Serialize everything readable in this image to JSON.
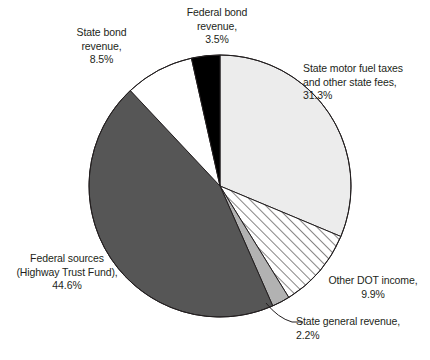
{
  "chart_data": {
    "type": "pie",
    "title": "",
    "subtitle": "",
    "xlabel": "",
    "ylabel": "",
    "legend_position": "none",
    "grid": false,
    "units": "percent",
    "start_angle_deg": 0,
    "direction": "clockwise",
    "categories": [
      "State motor fuel taxes and other state fees",
      "Other DOT income",
      "State general revenue",
      "Federal sources (Highway Trust Fund)",
      "State bond revenue",
      "Federal bond revenue"
    ],
    "values": [
      31.3,
      9.9,
      2.2,
      44.6,
      8.5,
      3.5
    ],
    "slices": [
      {
        "name": "state-motor-fuel-taxes",
        "label": "State motor fuel taxes\nand other state fees,\n31.3%",
        "value": 31.3,
        "value_text": "31.3%",
        "fill": "#ececec",
        "pattern": "solid",
        "start_deg": 0,
        "end_deg": 112.68
      },
      {
        "name": "other-dot-income",
        "label": "Other DOT income,\n9.9%",
        "value": 9.9,
        "value_text": "9.9%",
        "fill": "#ffffff",
        "pattern": "diagonal-hatch",
        "start_deg": 112.68,
        "end_deg": 148.32
      },
      {
        "name": "state-general-revenue",
        "label": "State general revenue,\n2.2%",
        "value": 2.2,
        "value_text": "2.2%",
        "fill": "#b2b2b2",
        "pattern": "solid",
        "start_deg": 148.32,
        "end_deg": 156.24
      },
      {
        "name": "federal-sources-highway-trust-fund",
        "label": "Federal sources\n(Highway Trust Fund),\n44.6%",
        "value": 44.6,
        "value_text": "44.6%",
        "fill": "#565656",
        "pattern": "solid",
        "start_deg": 156.24,
        "end_deg": 316.8
      },
      {
        "name": "state-bond-revenue",
        "label": "State bond\nrevenue,\n8.5%",
        "value": 8.5,
        "value_text": "8.5%",
        "fill": "#ffffff",
        "pattern": "solid",
        "start_deg": 316.8,
        "end_deg": 347.4
      },
      {
        "name": "federal-bond-revenue",
        "label": "Federal bond\nrevenue,\n3.5%",
        "value": 3.5,
        "value_text": "3.5%",
        "fill": "#000000",
        "pattern": "solid",
        "start_deg": 347.4,
        "end_deg": 360
      }
    ],
    "colors": {
      "outline": "#231f20",
      "text": "#231f20",
      "background": "#ffffff",
      "light_gray": "#ececec",
      "mid_gray": "#b2b2b2",
      "dark_gray": "#565656",
      "black": "#000000",
      "white": "#ffffff"
    }
  }
}
